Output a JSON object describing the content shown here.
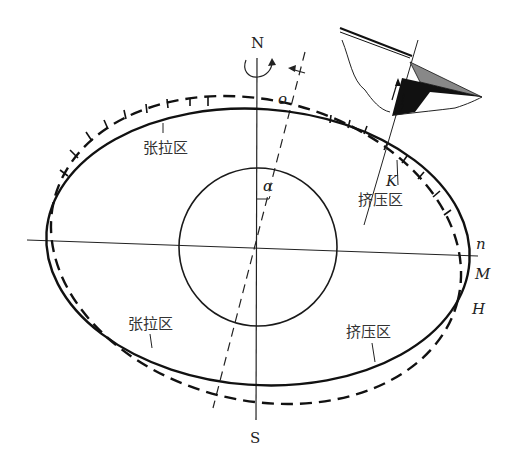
{
  "diagram": {
    "type": "tunnel deformation schematic",
    "compass": {
      "north": "N",
      "south": "S"
    },
    "angle_label": "α",
    "points": {
      "o": "o",
      "K": "K",
      "n": "n",
      "M": "M",
      "H": "H"
    },
    "zones": {
      "upper_left": "张拉区",
      "upper_right": "挤压区",
      "lower_left": "张拉区",
      "lower_right": "挤压区"
    },
    "legend_lines": {
      "solid": "original contour",
      "dashed": "deformed contour",
      "dash_axis": "rotated axis"
    },
    "colors": {
      "stroke": "#1a1a1a",
      "background": "#ffffff"
    }
  }
}
